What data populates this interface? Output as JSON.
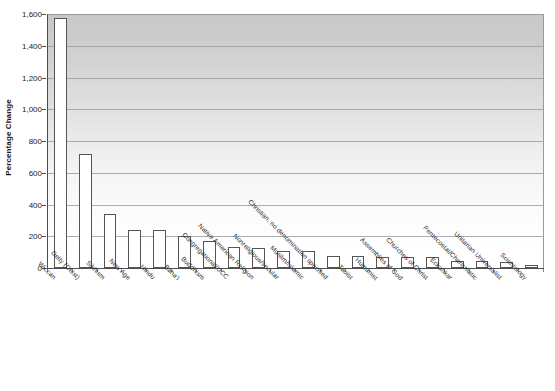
{
  "chart_data": {
    "type": "bar",
    "title": "",
    "xlabel": "",
    "ylabel": "Percentage Change",
    "ylim": [
      0,
      1600
    ],
    "ytick_values": [
      0,
      200,
      400,
      600,
      800,
      1000,
      1200,
      1400,
      1600
    ],
    "ytick_labels": [
      "0",
      "200",
      "400",
      "600",
      "800",
      "1,000",
      "1,200",
      "1,400",
      "1,600"
    ],
    "grid": true,
    "legend": "none",
    "bar_fill_color": "#ffffff",
    "bar_edge_color": "#555555",
    "plot_background": "vertical gradient gray to white",
    "categories": [
      "Wiccan",
      "Deity (Deist)",
      "Sikhism",
      "New Age",
      "Hindu",
      "Baha'i",
      "Buddhism",
      "Congregational/UCC",
      "Native American Religion",
      "Nonreligious/secular",
      "Muslim/Islamic",
      "Christian, no denomination specified",
      "Taoist",
      "Humanist",
      "Assemblies of God",
      "Churches of Christ",
      "Eckankar",
      "Pentecostal/Charismatic",
      "Unitarian Universalist",
      "Scientology"
    ],
    "values": [
      1575,
      717,
      338,
      240,
      237,
      200,
      170,
      133,
      125,
      110,
      109,
      78,
      74,
      69,
      68,
      67,
      46,
      43,
      38,
      22
    ]
  },
  "axis": {
    "y_title": "Percentage Change"
  }
}
